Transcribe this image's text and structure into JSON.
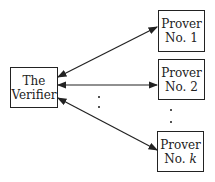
{
  "diagram": {
    "verifier": {
      "line1": "The",
      "line2": "Verifier"
    },
    "provers": [
      {
        "line1": "Prover",
        "line2": "No. 1"
      },
      {
        "line1": "Prover",
        "line2": "No. 2"
      },
      {
        "line1": "Prover",
        "line2_prefix": "No. ",
        "line2_var": "k"
      }
    ],
    "ellipsis": "..."
  }
}
